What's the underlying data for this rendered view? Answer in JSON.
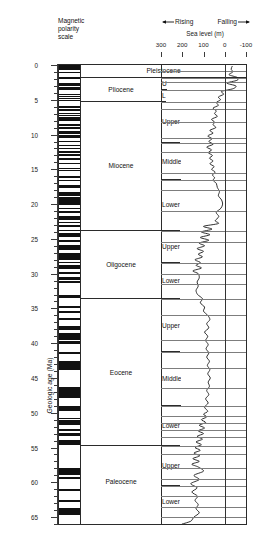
{
  "figure": {
    "magnetic_polarity_label": [
      "Magnetic",
      "polarity",
      "scale"
    ],
    "rising_label": "Rising",
    "falling_label": "Falling",
    "sea_level_label": "Sea level (m)",
    "y_axis_title": "Geologic age (Ma)"
  },
  "chart_data": {
    "type": "line",
    "title": "Sea level (m)",
    "xlabel": "Sea level (m)",
    "ylabel": "Geologic age (Ma)",
    "xlim": [
      300,
      -100
    ],
    "ylim": [
      0,
      66
    ],
    "y_inverted": true,
    "grid": true,
    "legend": "none",
    "annotations": [
      "Rising",
      "Falling"
    ],
    "x_ticks": [
      300,
      200,
      100,
      0,
      -100
    ],
    "x_tick_labels": [
      "300",
      "200",
      "100",
      "0",
      "-100"
    ],
    "y_ticks": [
      0,
      5,
      10,
      15,
      20,
      25,
      30,
      35,
      40,
      45,
      50,
      55,
      60,
      65
    ],
    "y_tick_labels": [
      "0",
      "5",
      "10",
      "15",
      "20",
      "25",
      "30",
      "35",
      "40",
      "45",
      "50",
      "55",
      "60",
      "65"
    ],
    "y_minor_ticks": [
      1,
      2,
      3,
      4,
      6,
      7,
      8,
      9,
      11,
      12,
      13,
      14,
      16,
      17,
      18,
      19,
      21,
      22,
      23,
      24,
      26,
      27,
      28,
      29,
      31,
      32,
      33,
      34,
      36,
      37,
      38,
      39,
      41,
      42,
      43,
      44,
      46,
      47,
      48,
      49,
      51,
      52,
      53,
      54,
      56,
      57,
      58,
      59,
      61,
      62,
      63,
      64,
      65,
      66
    ],
    "series": [
      {
        "name": "Global sea level (Haq curve)",
        "points": [
          [
            -35,
            0.2
          ],
          [
            -30,
            0.6
          ],
          [
            -38,
            1.0
          ],
          [
            -20,
            1.4
          ],
          [
            -60,
            1.8
          ],
          [
            -58,
            2.2
          ],
          [
            -10,
            2.6
          ],
          [
            -52,
            3.0
          ],
          [
            -40,
            3.4
          ],
          [
            15,
            3.8
          ],
          [
            5,
            4.2
          ],
          [
            30,
            4.6
          ],
          [
            20,
            5.0
          ],
          [
            40,
            5.4
          ],
          [
            30,
            5.8
          ],
          [
            55,
            6.2
          ],
          [
            40,
            6.6
          ],
          [
            48,
            7.0
          ],
          [
            35,
            7.4
          ],
          [
            62,
            7.8
          ],
          [
            48,
            8.2
          ],
          [
            55,
            8.6
          ],
          [
            42,
            9.0
          ],
          [
            70,
            9.4
          ],
          [
            55,
            9.8
          ],
          [
            80,
            10.2
          ],
          [
            60,
            10.6
          ],
          [
            75,
            11.0
          ],
          [
            55,
            11.4
          ],
          [
            85,
            11.8
          ],
          [
            62,
            12.2
          ],
          [
            78,
            12.6
          ],
          [
            58,
            13.0
          ],
          [
            72,
            13.4
          ],
          [
            55,
            13.8
          ],
          [
            70,
            14.2
          ],
          [
            50,
            14.6
          ],
          [
            62,
            15.0
          ],
          [
            45,
            15.4
          ],
          [
            58,
            15.8
          ],
          [
            48,
            16.2
          ],
          [
            55,
            16.6
          ],
          [
            40,
            17.0
          ],
          [
            35,
            17.6
          ],
          [
            25,
            18.2
          ],
          [
            30,
            18.8
          ],
          [
            15,
            19.4
          ],
          [
            10,
            20.0
          ],
          [
            18,
            20.6
          ],
          [
            40,
            21.2
          ],
          [
            28,
            21.8
          ],
          [
            45,
            22.4
          ],
          [
            30,
            22.8
          ],
          [
            100,
            23.2
          ],
          [
            60,
            23.6
          ],
          [
            110,
            24.0
          ],
          [
            70,
            24.4
          ],
          [
            115,
            24.8
          ],
          [
            75,
            25.2
          ],
          [
            120,
            25.6
          ],
          [
            95,
            26.0
          ],
          [
            130,
            26.4
          ],
          [
            100,
            26.8
          ],
          [
            125,
            27.2
          ],
          [
            105,
            27.6
          ],
          [
            140,
            28.0
          ],
          [
            115,
            28.4
          ],
          [
            135,
            28.8
          ],
          [
            110,
            29.2
          ],
          [
            150,
            29.6
          ],
          [
            125,
            30.0
          ],
          [
            120,
            30.6
          ],
          [
            130,
            31.2
          ],
          [
            125,
            31.8
          ],
          [
            135,
            32.4
          ],
          [
            128,
            33.0
          ],
          [
            105,
            33.6
          ],
          [
            115,
            34.2
          ],
          [
            95,
            34.8
          ],
          [
            100,
            35.4
          ],
          [
            80,
            36.0
          ],
          [
            70,
            36.6
          ],
          [
            85,
            37.2
          ],
          [
            75,
            37.8
          ],
          [
            95,
            38.4
          ],
          [
            80,
            39.0
          ],
          [
            90,
            39.6
          ],
          [
            78,
            40.2
          ],
          [
            88,
            40.8
          ],
          [
            75,
            41.4
          ],
          [
            85,
            42.0
          ],
          [
            72,
            42.6
          ],
          [
            82,
            43.2
          ],
          [
            70,
            43.8
          ],
          [
            80,
            44.4
          ],
          [
            68,
            45.0
          ],
          [
            78,
            45.6
          ],
          [
            72,
            46.2
          ],
          [
            85,
            46.8
          ],
          [
            75,
            47.4
          ],
          [
            90,
            48.0
          ],
          [
            78,
            48.6
          ],
          [
            95,
            49.2
          ],
          [
            80,
            49.8
          ],
          [
            100,
            50.2
          ],
          [
            85,
            50.6
          ],
          [
            110,
            51.0
          ],
          [
            90,
            51.4
          ],
          [
            120,
            51.8
          ],
          [
            95,
            52.2
          ],
          [
            125,
            52.6
          ],
          [
            100,
            53.0
          ],
          [
            130,
            53.4
          ],
          [
            105,
            53.8
          ],
          [
            135,
            54.2
          ],
          [
            110,
            54.6
          ],
          [
            140,
            55.0
          ],
          [
            115,
            55.4
          ],
          [
            145,
            55.8
          ],
          [
            118,
            56.2
          ],
          [
            150,
            56.6
          ],
          [
            120,
            57.0
          ],
          [
            155,
            57.4
          ],
          [
            125,
            57.8
          ],
          [
            100,
            58.4
          ],
          [
            145,
            59.0
          ],
          [
            120,
            59.6
          ],
          [
            160,
            60.2
          ],
          [
            130,
            60.8
          ],
          [
            155,
            61.4
          ],
          [
            128,
            62.0
          ],
          [
            140,
            62.6
          ],
          [
            125,
            63.2
          ],
          [
            135,
            63.8
          ],
          [
            120,
            64.4
          ],
          [
            145,
            65.0
          ],
          [
            160,
            65.6
          ],
          [
            200,
            66.0
          ]
        ]
      }
    ]
  },
  "time_scale": {
    "column_headers": [
      "Magnetic polarity scale",
      "Epoch",
      "Sub-epoch",
      "Sea level (m)"
    ],
    "epochs": [
      {
        "name": "Pleistocene",
        "top": 0.0,
        "bottom": 1.8,
        "subs": []
      },
      {
        "name": "Pliocene",
        "top": 1.8,
        "bottom": 5.3,
        "subs": [
          {
            "name": "U",
            "top": 1.8,
            "bottom": 3.6
          },
          {
            "name": "L",
            "top": 3.6,
            "bottom": 5.3
          }
        ]
      },
      {
        "name": "Miocene",
        "top": 5.3,
        "bottom": 23.8,
        "subs": [
          {
            "name": "Upper",
            "top": 5.3,
            "bottom": 11.2
          },
          {
            "name": "Middle",
            "top": 11.2,
            "bottom": 16.6
          },
          {
            "name": "Lower",
            "top": 16.6,
            "bottom": 23.8
          }
        ]
      },
      {
        "name": "Oligocene",
        "top": 23.8,
        "bottom": 33.7,
        "subs": [
          {
            "name": "Upper",
            "top": 23.8,
            "bottom": 28.5
          },
          {
            "name": "Lower",
            "top": 28.5,
            "bottom": 33.7
          }
        ]
      },
      {
        "name": "Eocene",
        "top": 33.7,
        "bottom": 54.8,
        "subs": [
          {
            "name": "Upper",
            "top": 33.7,
            "bottom": 41.3
          },
          {
            "name": "Middle",
            "top": 41.3,
            "bottom": 49.0
          },
          {
            "name": "Lower",
            "top": 49.0,
            "bottom": 54.8
          }
        ]
      },
      {
        "name": "Paleocene",
        "top": 54.8,
        "bottom": 65.0,
        "subs": [
          {
            "name": "Upper",
            "top": 54.8,
            "bottom": 60.5
          },
          {
            "name": "Lower",
            "top": 60.5,
            "bottom": 65.0
          }
        ]
      }
    ]
  },
  "magnetic_polarity": {
    "description": "Black = normal polarity, white = reversed polarity",
    "normal_bands": [
      [
        0.0,
        0.78
      ],
      [
        0.99,
        1.07
      ],
      [
        1.77,
        1.95
      ],
      [
        2.58,
        3.04
      ],
      [
        3.11,
        3.22
      ],
      [
        3.33,
        3.58
      ],
      [
        4.18,
        4.29
      ],
      [
        4.48,
        4.62
      ],
      [
        4.8,
        4.89
      ],
      [
        4.98,
        5.23
      ],
      [
        5.89,
        6.14
      ],
      [
        6.27,
        6.57
      ],
      [
        6.94,
        7.09
      ],
      [
        7.14,
        7.25
      ],
      [
        7.46,
        7.55
      ],
      [
        7.65,
        8.07
      ],
      [
        8.53,
        8.78
      ],
      [
        8.95,
        9.23
      ],
      [
        9.46,
        9.58
      ],
      [
        9.64,
        9.88
      ],
      [
        10.02,
        10.43
      ],
      [
        10.95,
        11.05
      ],
      [
        11.48,
        11.53
      ],
      [
        11.94,
        12.08
      ],
      [
        12.4,
        12.68
      ],
      [
        12.84,
        13.02
      ],
      [
        13.32,
        13.7
      ],
      [
        14.08,
        14.2
      ],
      [
        14.8,
        14.89
      ],
      [
        15.04,
        15.16
      ],
      [
        16.01,
        16.29
      ],
      [
        16.49,
        16.75
      ],
      [
        17.31,
        17.65
      ],
      [
        18.28,
        18.78
      ],
      [
        19.05,
        20.13
      ],
      [
        20.52,
        20.75
      ],
      [
        21.02,
        21.32
      ],
      [
        21.77,
        21.94
      ],
      [
        22.07,
        22.25
      ],
      [
        22.6,
        22.76
      ],
      [
        23.07,
        23.35
      ],
      [
        23.68,
        23.8
      ],
      [
        24.12,
        24.73
      ],
      [
        25.18,
        25.5
      ],
      [
        25.82,
        26.55
      ],
      [
        27.03,
        27.97
      ],
      [
        28.28,
        28.51
      ],
      [
        28.75,
        29.4
      ],
      [
        29.72,
        30.1
      ],
      [
        30.48,
        30.94
      ],
      [
        31.03,
        31.36
      ],
      [
        33.06,
        33.55
      ],
      [
        34.66,
        34.94
      ],
      [
        35.34,
        35.7
      ],
      [
        36.34,
        36.62
      ],
      [
        37.47,
        37.6
      ],
      [
        37.66,
        38.08
      ],
      [
        38.53,
        39.55
      ],
      [
        39.63,
        40.13
      ],
      [
        41.26,
        41.52
      ],
      [
        42.54,
        43.79
      ],
      [
        46.26,
        47.91
      ],
      [
        49.04,
        49.72
      ],
      [
        50.78,
        50.95
      ],
      [
        51.05,
        51.74
      ],
      [
        52.36,
        52.66
      ],
      [
        52.9,
        53.35
      ],
      [
        53.93,
        54.65
      ],
      [
        57.91,
        58.93
      ],
      [
        59.2,
        59.55
      ],
      [
        60.92,
        61.28
      ],
      [
        62.5,
        62.77
      ],
      [
        63.63,
        64.75
      ]
    ]
  }
}
